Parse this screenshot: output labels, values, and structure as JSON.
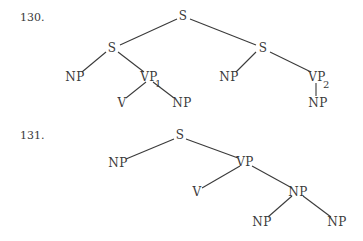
{
  "diagrams": [
    {
      "number": "130.",
      "nodes": {
        "root": "S",
        "s_left": "S",
        "s_right": "S",
        "np_a": "NP",
        "vp1": "VP",
        "vp1_sub": "1",
        "np_b": "NP",
        "vp2": "VP",
        "vp2_sub": "2",
        "v": "V",
        "np_c": "NP",
        "np_d": "NP"
      }
    },
    {
      "number": "131.",
      "nodes": {
        "root": "S",
        "np_a": "NP",
        "vp": "VP",
        "v": "V",
        "np_b": "NP",
        "np_c": "NP",
        "np_d": "NP"
      }
    }
  ]
}
